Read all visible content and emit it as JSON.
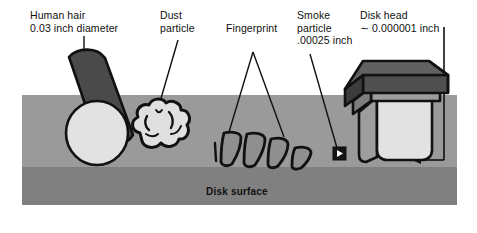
{
  "figure": {
    "colors": {
      "background": "#ffffff",
      "surface_upper": "#9a9a9a",
      "surface_lower": "#808080",
      "object_light": "#e8e8e8",
      "object_dark": "#4a4a4a",
      "object_mid": "#6e6e6e",
      "outline": "#111111",
      "text": "#101010"
    },
    "labels": [
      {
        "name": "human-hair",
        "line1": "Human hair",
        "line2": "0.03 inch diameter",
        "line3": ""
      },
      {
        "name": "dust-particle",
        "line1": "Dust",
        "line2": "particle",
        "line3": ""
      },
      {
        "name": "fingerprint",
        "line1": "Fingerprint",
        "line2": "",
        "line3": ""
      },
      {
        "name": "smoke-particle",
        "line1": "Smoke",
        "line2": "particle",
        "line3": ".00025 inch"
      },
      {
        "name": "disk-head",
        "line1": "Disk head",
        "line2": "∼ 0.000001 inch",
        "line3": ""
      }
    ],
    "surface_label": "Disk surface"
  }
}
